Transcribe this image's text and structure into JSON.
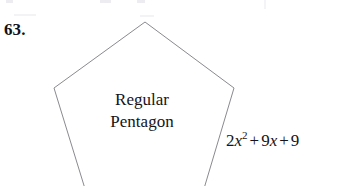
{
  "page": {
    "background_color": "#ffffff",
    "width": 350,
    "height": 186
  },
  "problem": {
    "number_label": "63."
  },
  "figure": {
    "shape_name": "regular-pentagon",
    "stroke_color": "#8a8a8f",
    "fill_color": "#ffffff",
    "caption_line_1": "Regular",
    "caption_line_2": "Pentagon",
    "vertices_px": [
      [
        145,
        22
      ],
      [
        234,
        88
      ],
      [
        203,
        192
      ],
      [
        86,
        192
      ],
      [
        54,
        88
      ]
    ],
    "clipped_at_bottom": true
  },
  "side_label": {
    "coefficient_quadratic": "2",
    "variable": "x",
    "exponent": "2",
    "operator_1": "+",
    "coefficient_linear": "9",
    "variable_2": "x",
    "operator_2": "+",
    "constant": "9",
    "full_text": "2x^2 + 9x + 9"
  }
}
